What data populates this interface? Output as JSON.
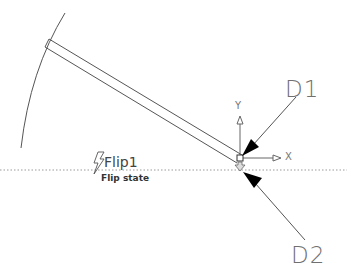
{
  "drawing": {
    "labels": {
      "d1": "D1",
      "d2": "D2",
      "x_axis": "X",
      "y_axis": "Y"
    },
    "block": {
      "name": "Flip1",
      "state": "Flip state",
      "icon": "lightning-bolt-icon"
    },
    "colors": {
      "line": "#555555",
      "arrow": "#000000",
      "dotted": "#9a9a9a",
      "text": "#707070"
    }
  }
}
